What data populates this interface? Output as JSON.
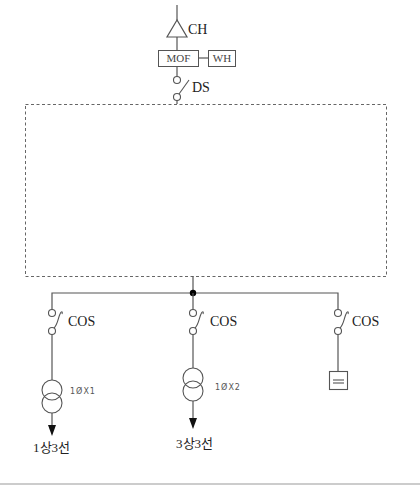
{
  "diagram": {
    "type": "single-line electrical diagram",
    "incoming": {
      "ch_label": "CH",
      "mof_label": "MOF",
      "wh_label": "WH",
      "ds_label": "DS"
    },
    "branches": [
      {
        "cos_label": "COS",
        "transformer_label": "1ØX1",
        "output_label": "1상3선",
        "load": "transformer"
      },
      {
        "cos_label": "COS",
        "transformer_label": "1ØX2",
        "output_label": "3상3선",
        "load": "transformer"
      },
      {
        "cos_label": "COS",
        "transformer_label": null,
        "output_label": null,
        "load": "capacitor-box"
      }
    ],
    "colors": {
      "line": "#555555",
      "dashed_box": "#666666",
      "junction": "#000000"
    }
  }
}
